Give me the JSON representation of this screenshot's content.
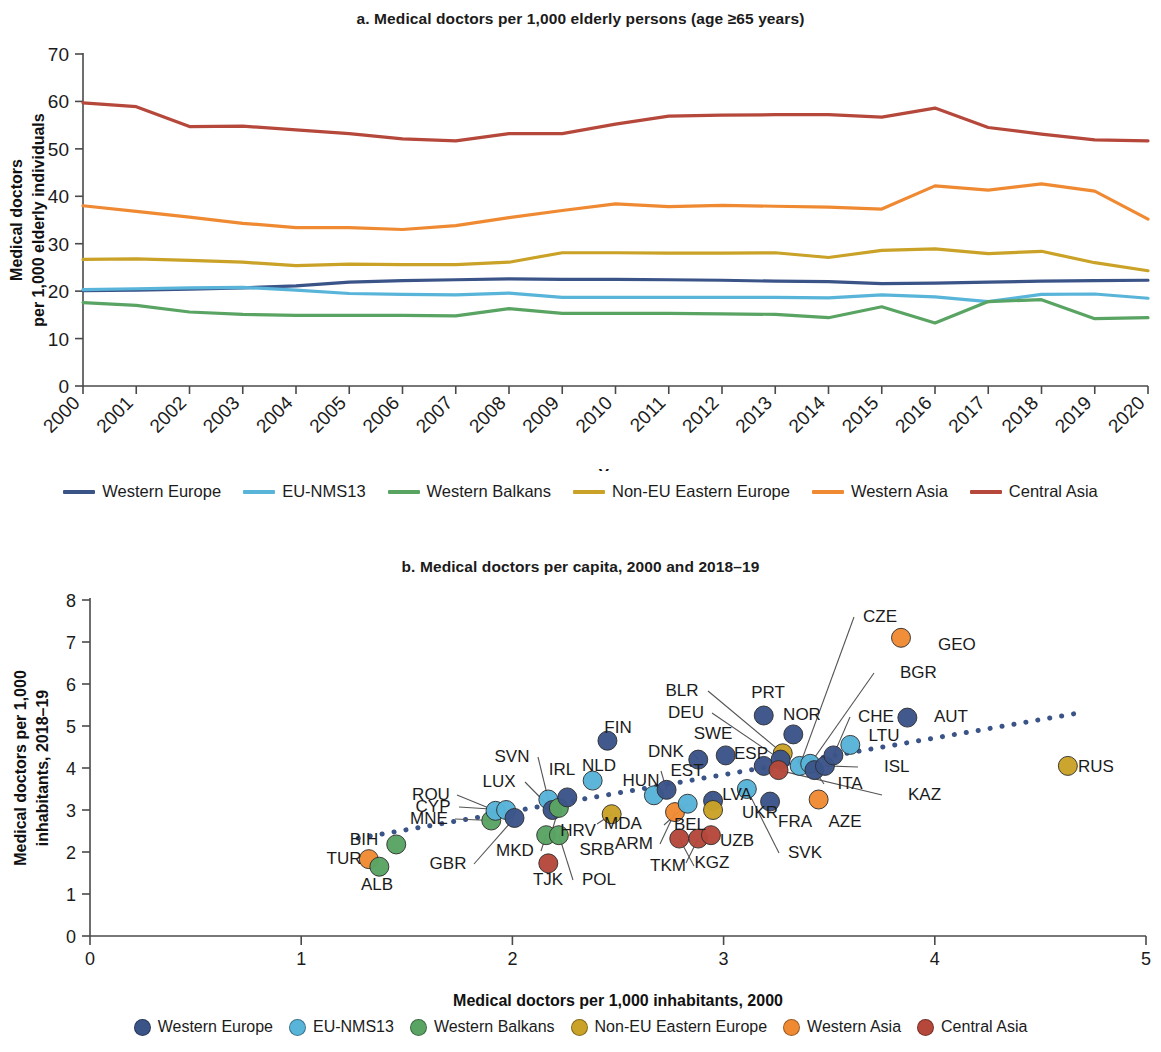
{
  "panel_a": {
    "title": "a. Medical doctors per 1,000 elderly persons (age ≥65 years)",
    "ylabel_line1": "Medical doctors",
    "ylabel_line2": "per 1,000 elderly individuals",
    "xlabel": "Year"
  },
  "panel_b": {
    "title": "b. Medical doctors per capita, 2000 and 2018–19",
    "ylabel_line1": "Medical doctors per 1,000",
    "ylabel_line2": "inhabitants, 2018–19",
    "xlabel": "Medical doctors per 1,000 inhabitants, 2000"
  },
  "colors": {
    "western_europe": "#3b5488",
    "eu_nms13": "#58b4d9",
    "western_balkans": "#5aa463",
    "non_eu_eastern_europe": "#c9a227",
    "western_asia": "#ef8a33",
    "central_asia": "#b5483b",
    "trendline": "#3b5488",
    "axis": "#4a4a4a"
  },
  "legend": [
    {
      "label": "Western Europe",
      "color_key": "western_europe"
    },
    {
      "label": "EU-NMS13",
      "color_key": "eu_nms13"
    },
    {
      "label": "Western Balkans",
      "color_key": "western_balkans"
    },
    {
      "label": "Non-EU Eastern Europe",
      "color_key": "non_eu_eastern_europe"
    },
    {
      "label": "Western Asia",
      "color_key": "western_asia"
    },
    {
      "label": "Central Asia",
      "color_key": "central_asia"
    }
  ],
  "chart_data": [
    {
      "type": "line",
      "title": "a. Medical doctors per 1,000 elderly persons (age ≥65 years)",
      "xlabel": "Year",
      "ylabel": "Medical doctors per 1,000 elderly individuals",
      "xlim": [
        2000,
        2020
      ],
      "ylim": [
        0,
        70
      ],
      "yticks": [
        0,
        10,
        20,
        30,
        40,
        50,
        60,
        70
      ],
      "grid": false,
      "legend_position": "bottom",
      "x": [
        2000,
        2001,
        2002,
        2003,
        2004,
        2005,
        2006,
        2007,
        2008,
        2009,
        2010,
        2011,
        2012,
        2013,
        2014,
        2015,
        2016,
        2017,
        2018,
        2019,
        2020
      ],
      "series": [
        {
          "name": "Western Europe",
          "color": "#3b5488",
          "values": [
            20.1,
            20.2,
            20.4,
            20.7,
            21.1,
            21.9,
            22.2,
            22.4,
            22.6,
            22.5,
            22.5,
            22.4,
            22.3,
            22.1,
            22.0,
            21.6,
            21.7,
            21.9,
            22.1,
            22.2,
            22.3
          ]
        },
        {
          "name": "EU-NMS13",
          "color": "#58b4d9",
          "values": [
            20.3,
            20.5,
            20.7,
            20.8,
            20.2,
            19.5,
            19.3,
            19.2,
            19.6,
            18.7,
            18.7,
            18.7,
            18.7,
            18.7,
            18.6,
            19.2,
            18.8,
            17.8,
            19.3,
            19.4,
            18.5
          ]
        },
        {
          "name": "Western Balkans",
          "color": "#5aa463",
          "values": [
            17.6,
            17.0,
            15.6,
            15.1,
            14.9,
            14.9,
            14.9,
            14.8,
            16.3,
            15.3,
            15.3,
            15.3,
            15.2,
            15.1,
            14.4,
            16.7,
            13.3,
            17.8,
            18.2,
            14.2,
            14.4
          ]
        },
        {
          "name": "Non-EU Eastern Europe",
          "color": "#c9a227",
          "values": [
            26.7,
            26.8,
            26.5,
            26.1,
            25.4,
            25.7,
            25.6,
            25.6,
            26.1,
            28.1,
            28.1,
            28.0,
            28.0,
            28.1,
            27.1,
            28.6,
            28.9,
            27.9,
            28.4,
            26.0,
            24.3
          ]
        },
        {
          "name": "Western Asia",
          "color": "#ef8a33",
          "values": [
            38.0,
            36.8,
            35.6,
            34.3,
            33.4,
            33.4,
            33.0,
            33.8,
            35.5,
            37.0,
            38.4,
            37.8,
            38.1,
            37.9,
            37.7,
            37.3,
            42.2,
            41.3,
            42.6,
            41.1,
            35.2
          ]
        },
        {
          "name": "Central Asia",
          "color": "#b5483b",
          "values": [
            59.7,
            58.9,
            54.7,
            54.8,
            54.0,
            53.2,
            52.1,
            51.7,
            53.2,
            53.2,
            55.2,
            56.9,
            57.1,
            57.2,
            57.2,
            56.7,
            58.6,
            54.5,
            53.1,
            51.9,
            51.7
          ]
        }
      ]
    },
    {
      "type": "scatter",
      "title": "b. Medical doctors per capita, 2000 and 2018–19",
      "xlabel": "Medical doctors per 1,000 inhabitants, 2000",
      "ylabel": "Medical doctors per 1,000 inhabitants, 2018–19",
      "xlim": [
        0,
        5
      ],
      "ylim": [
        0,
        8
      ],
      "xticks": [
        0,
        1,
        2,
        3,
        4,
        5
      ],
      "yticks": [
        0,
        1,
        2,
        3,
        4,
        5,
        6,
        7,
        8
      ],
      "grid": false,
      "legend_position": "bottom",
      "trendline": {
        "x0": 1.27,
        "y0": 2.33,
        "x1": 4.67,
        "y1": 5.3,
        "style": "dotted",
        "color": "#3b5488"
      },
      "points": [
        {
          "code": "TUR",
          "x": 1.32,
          "y": 1.83,
          "group": "Western Asia"
        },
        {
          "code": "ALB",
          "x": 1.37,
          "y": 1.65,
          "group": "Western Balkans"
        },
        {
          "code": "BIH",
          "x": 1.45,
          "y": 2.18,
          "group": "Western Balkans"
        },
        {
          "code": "MNE",
          "x": 1.9,
          "y": 2.75,
          "group": "Western Balkans"
        },
        {
          "code": "ROU",
          "x": 1.92,
          "y": 2.98,
          "group": "EU-NMS13"
        },
        {
          "code": "CYP",
          "x": 1.97,
          "y": 3.0,
          "group": "EU-NMS13"
        },
        {
          "code": "GBR",
          "x": 2.01,
          "y": 2.81,
          "group": "Western Europe"
        },
        {
          "code": "MKD",
          "x": 2.16,
          "y": 2.4,
          "group": "Western Balkans"
        },
        {
          "code": "SVN",
          "x": 2.17,
          "y": 3.25,
          "group": "EU-NMS13"
        },
        {
          "code": "LUX",
          "x": 2.19,
          "y": 3.0,
          "group": "Western Europe"
        },
        {
          "code": "HRV",
          "x": 2.22,
          "y": 3.05,
          "group": "Western Balkans"
        },
        {
          "code": "TJK",
          "x": 2.17,
          "y": 1.73,
          "group": "Central Asia"
        },
        {
          "code": "POL",
          "x": 2.22,
          "y": 2.4,
          "group": "Western Balkans"
        },
        {
          "code": "IRL",
          "x": 2.26,
          "y": 3.3,
          "group": "Western Europe"
        },
        {
          "code": "NLD",
          "x": 2.38,
          "y": 3.7,
          "group": "EU-NMS13"
        },
        {
          "code": "MDA",
          "x": 2.47,
          "y": 2.9,
          "group": "Non-EU Eastern Europe"
        },
        {
          "code": "FIN",
          "x": 2.45,
          "y": 4.65,
          "group": "Western Europe"
        },
        {
          "code": "HUN",
          "x": 2.67,
          "y": 3.35,
          "group": "EU-NMS13"
        },
        {
          "code": "ARM",
          "x": 2.77,
          "y": 2.95,
          "group": "Western Asia"
        },
        {
          "code": "EST",
          "x": 2.73,
          "y": 3.48,
          "group": "Western Europe"
        },
        {
          "code": "BEL",
          "x": 2.83,
          "y": 3.15,
          "group": "EU-NMS13"
        },
        {
          "code": "TKM",
          "x": 2.79,
          "y": 2.32,
          "group": "Central Asia"
        },
        {
          "code": "KGZ",
          "x": 2.88,
          "y": 2.32,
          "group": "Central Asia"
        },
        {
          "code": "DNK",
          "x": 2.88,
          "y": 4.2,
          "group": "Western Europe"
        },
        {
          "code": "LVA",
          "x": 2.95,
          "y": 3.22,
          "group": "Western Europe"
        },
        {
          "code": "UZB",
          "x": 2.94,
          "y": 2.4,
          "group": "Central Asia"
        },
        {
          "code": "UKR",
          "x": 2.95,
          "y": 3.0,
          "group": "Non-EU Eastern Europe"
        },
        {
          "code": "SWE",
          "x": 3.01,
          "y": 4.3,
          "group": "Western Europe"
        },
        {
          "code": "SVK",
          "x": 3.11,
          "y": 3.5,
          "group": "EU-NMS13"
        },
        {
          "code": "ESP",
          "x": 3.19,
          "y": 4.05,
          "group": "Western Europe"
        },
        {
          "code": "FRA",
          "x": 3.22,
          "y": 3.2,
          "group": "Western Europe"
        },
        {
          "code": "BLR",
          "x": 3.28,
          "y": 4.35,
          "group": "Non-EU Eastern Europe"
        },
        {
          "code": "DEU",
          "x": 3.27,
          "y": 4.2,
          "group": "Western Europe"
        },
        {
          "code": "KAZ",
          "x": 3.26,
          "y": 3.95,
          "group": "Central Asia"
        },
        {
          "code": "PRT",
          "x": 3.19,
          "y": 5.25,
          "group": "Western Europe"
        },
        {
          "code": "AZE",
          "x": 3.45,
          "y": 3.25,
          "group": "Western Asia"
        },
        {
          "code": "NOR",
          "x": 3.33,
          "y": 4.8,
          "group": "Western Europe"
        },
        {
          "code": "CZE",
          "x": 3.36,
          "y": 4.05,
          "group": "EU-NMS13"
        },
        {
          "code": "BGR",
          "x": 3.41,
          "y": 4.1,
          "group": "EU-NMS13"
        },
        {
          "code": "ITA",
          "x": 3.43,
          "y": 3.95,
          "group": "Western Europe"
        },
        {
          "code": "ISL",
          "x": 3.48,
          "y": 4.05,
          "group": "Western Europe"
        },
        {
          "code": "CHE",
          "x": 3.52,
          "y": 4.3,
          "group": "Western Europe"
        },
        {
          "code": "LTU",
          "x": 3.6,
          "y": 4.55,
          "group": "EU-NMS13"
        },
        {
          "code": "GEO",
          "x": 3.84,
          "y": 7.1,
          "group": "Western Asia"
        },
        {
          "code": "AUT",
          "x": 3.87,
          "y": 5.2,
          "group": "Western Europe"
        },
        {
          "code": "RUS",
          "x": 4.63,
          "y": 4.05,
          "group": "Non-EU Eastern Europe"
        }
      ],
      "point_labels": [
        {
          "code": "CZE",
          "lx": 880,
          "ly": 622,
          "anchor": "middle"
        },
        {
          "code": "GEO",
          "lx": 938,
          "ly": 650,
          "anchor": "start"
        },
        {
          "code": "BGR",
          "lx": 900,
          "ly": 678,
          "anchor": "start"
        },
        {
          "code": "BLR",
          "lx": 682,
          "ly": 696,
          "anchor": "middle"
        },
        {
          "code": "PRT",
          "lx": 768,
          "ly": 698,
          "anchor": "middle"
        },
        {
          "code": "DEU",
          "lx": 686,
          "ly": 718,
          "anchor": "middle"
        },
        {
          "code": "NOR",
          "lx": 802,
          "ly": 720,
          "anchor": "middle"
        },
        {
          "code": "CHE",
          "lx": 876,
          "ly": 722,
          "anchor": "middle"
        },
        {
          "code": "AUT",
          "lx": 934,
          "ly": 722,
          "anchor": "start"
        },
        {
          "code": "SWE",
          "lx": 713,
          "ly": 739,
          "anchor": "middle"
        },
        {
          "code": "LTU",
          "lx": 884,
          "ly": 741,
          "anchor": "middle"
        },
        {
          "code": "FIN",
          "lx": 618,
          "ly": 733,
          "anchor": "middle"
        },
        {
          "code": "DNK",
          "lx": 666,
          "ly": 757,
          "anchor": "middle"
        },
        {
          "code": "ESP",
          "lx": 751,
          "ly": 759,
          "anchor": "middle"
        },
        {
          "code": "NLD",
          "lx": 599,
          "ly": 771,
          "anchor": "middle"
        },
        {
          "code": "SVN",
          "lx": 512,
          "ly": 762,
          "anchor": "middle"
        },
        {
          "code": "IRL",
          "lx": 562,
          "ly": 775,
          "anchor": "middle"
        },
        {
          "code": "HUN",
          "lx": 641,
          "ly": 786,
          "anchor": "middle"
        },
        {
          "code": "EST",
          "lx": 687,
          "ly": 776,
          "anchor": "middle"
        },
        {
          "code": "ISL",
          "lx": 884,
          "ly": 772,
          "anchor": "start"
        },
        {
          "code": "RUS",
          "lx": 1078,
          "ly": 772,
          "anchor": "start"
        },
        {
          "code": "LUX",
          "lx": 499,
          "ly": 787,
          "anchor": "middle"
        },
        {
          "code": "ITA",
          "lx": 850,
          "ly": 789,
          "anchor": "middle"
        },
        {
          "code": "ROU",
          "lx": 431,
          "ly": 800,
          "anchor": "middle"
        },
        {
          "code": "CYP",
          "lx": 433,
          "ly": 812,
          "anchor": "middle"
        },
        {
          "code": "LVA",
          "lx": 737,
          "ly": 800,
          "anchor": "middle"
        },
        {
          "code": "KAZ",
          "lx": 908,
          "ly": 800,
          "anchor": "start"
        },
        {
          "code": "MNE",
          "lx": 429,
          "ly": 824,
          "anchor": "middle"
        },
        {
          "code": "MDA",
          "lx": 623,
          "ly": 829,
          "anchor": "middle"
        },
        {
          "code": "BEL",
          "lx": 690,
          "ly": 830,
          "anchor": "middle"
        },
        {
          "code": "UKR",
          "lx": 760,
          "ly": 818,
          "anchor": "middle"
        },
        {
          "code": "FRA",
          "lx": 795,
          "ly": 827,
          "anchor": "middle"
        },
        {
          "code": "AZE",
          "lx": 845,
          "ly": 827,
          "anchor": "middle"
        },
        {
          "code": "HRV",
          "lx": 578,
          "ly": 836,
          "anchor": "middle"
        },
        {
          "code": "ARM",
          "lx": 634,
          "ly": 849,
          "anchor": "middle"
        },
        {
          "code": "UZB",
          "lx": 737,
          "ly": 846,
          "anchor": "middle"
        },
        {
          "code": "BIH",
          "lx": 364,
          "ly": 845,
          "anchor": "middle"
        },
        {
          "code": "TUR",
          "lx": 344,
          "ly": 864,
          "anchor": "middle"
        },
        {
          "code": "MKD",
          "lx": 515,
          "ly": 856,
          "anchor": "middle"
        },
        {
          "code": "GBR",
          "lx": 448,
          "ly": 869,
          "anchor": "middle"
        },
        {
          "code": "SRB",
          "lx": 597,
          "ly": 855,
          "anchor": "middle"
        },
        {
          "code": "SVK",
          "lx": 805,
          "ly": 858,
          "anchor": "middle"
        },
        {
          "code": "TKM",
          "lx": 668,
          "ly": 871,
          "anchor": "middle"
        },
        {
          "code": "KGZ",
          "lx": 712,
          "ly": 868,
          "anchor": "middle"
        },
        {
          "code": "ALB",
          "lx": 377,
          "ly": 890,
          "anchor": "middle"
        },
        {
          "code": "TJK",
          "lx": 548,
          "ly": 885,
          "anchor": "middle"
        },
        {
          "code": "POL",
          "lx": 599,
          "ly": 885,
          "anchor": "middle"
        }
      ]
    }
  ]
}
